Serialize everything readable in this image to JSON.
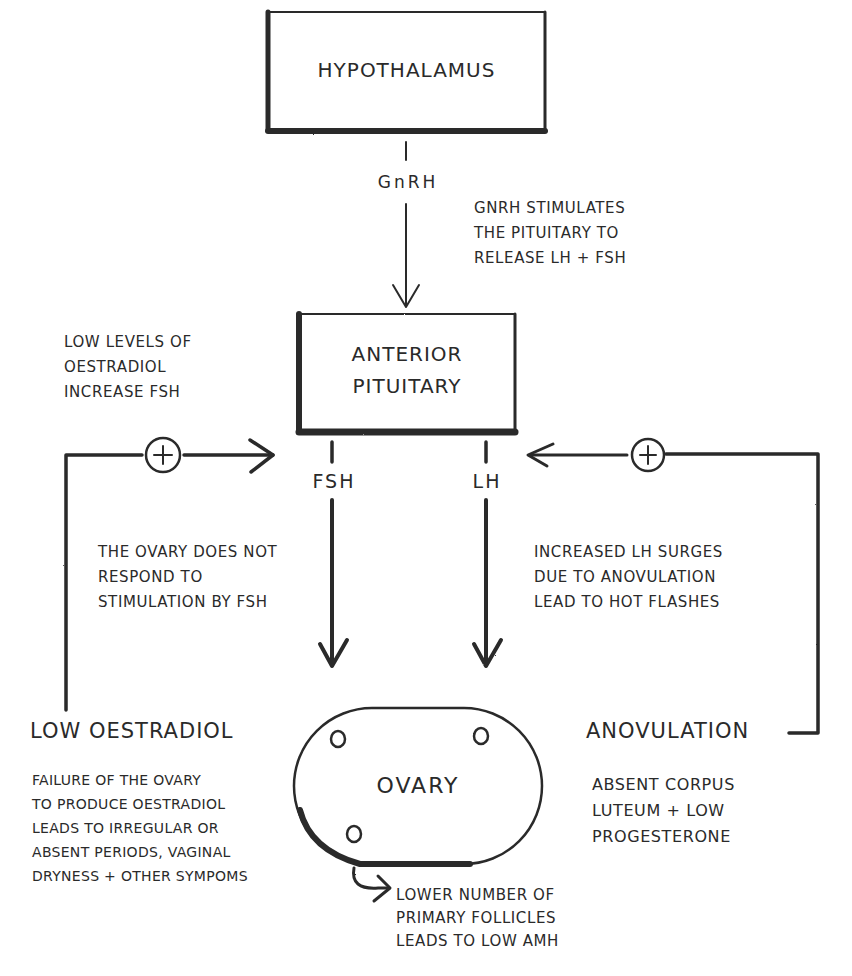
{
  "diagram": {
    "type": "hand-drawn flowchart",
    "colors": {
      "ink": "#2a2a2a",
      "background": "#ffffff"
    }
  },
  "nodes": {
    "hypothalamus": {
      "label": "HYPOTHALAMUS"
    },
    "anterior_pituitary": {
      "label": "ANTERIOR\nPITUITARY"
    },
    "ovary": {
      "label": "OVARY"
    }
  },
  "edges": {
    "gnrh": {
      "label": "GnRH",
      "from": "hypothalamus",
      "to": "anterior_pituitary"
    },
    "fsh": {
      "label": "FSH",
      "from": "anterior_pituitary",
      "to": "ovary"
    },
    "lh": {
      "label": "LH",
      "from": "anterior_pituitary",
      "to": "ovary"
    },
    "left_feedback": {
      "symbol": "+",
      "from": "low_oestradiol",
      "to": "anterior_pituitary"
    },
    "right_feedback": {
      "symbol": "+",
      "from": "anovulation",
      "to": "anterior_pituitary"
    }
  },
  "outcomes": {
    "low_oestradiol": {
      "label": "LOW OESTRADIOL"
    },
    "anovulation": {
      "label": "ANOVULATION"
    }
  },
  "annotations": {
    "gnrh_note": "GnRH STIMULATES\nTHE PITUITARY TO\nRELEASE LH + FSH",
    "feedback_note": "LOW LEVELS OF\nOESTRADIOL\nINCREASE FSH",
    "fsh_note": "THE OVARY DOES NOT\nRESPOND TO\nSTIMULATION BY FSH",
    "lh_note": "INCREASED LH SURGES\nDUE TO ANOVULATION\nLEAD TO HOT FLASHES",
    "oestradiol_note": "FAILURE OF THE OVARY\nTO PRODUCE OESTRADIOL\nLEADS TO IRREGULAR OR\nABSENT PERIODS, VAGINAL\nDRYNESS + OTHER SYMPOMS",
    "anovulation_note": "ABSENT CORPUS\nLUTEUM + LOW\nPROGESTERONE",
    "follicle_note": "LOWER NUMBER OF\nPRIMARY FOLLICLES\nLEADS TO LOW AMH"
  }
}
